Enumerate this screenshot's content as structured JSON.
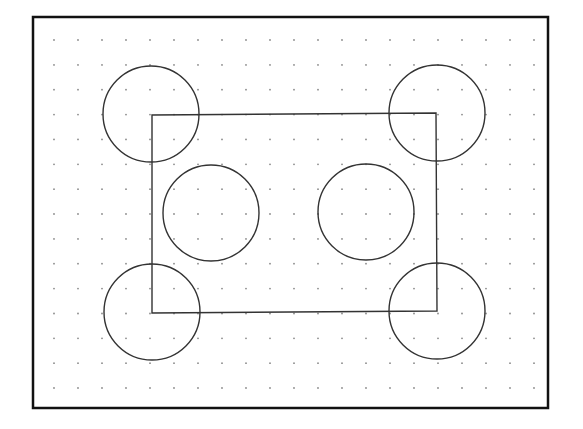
{
  "drawing": {
    "background": "#ffffff",
    "frame": {
      "x": 33,
      "y": 17,
      "width": 515,
      "height": 391,
      "stroke": "#111111",
      "stroke_width": 2.5
    },
    "grid": {
      "dot_color": "#8a8a8a",
      "dot_radius": 0.9,
      "x_start": 54,
      "x_step": 24,
      "columns": 21,
      "y_start": 40,
      "y_step": 24.86,
      "rows": 15
    },
    "shape_stroke": "#333333",
    "shape_stroke_width": 1.4,
    "rectangle": {
      "points": [
        [
          152,
          115
        ],
        [
          436,
          113
        ],
        [
          437,
          311
        ],
        [
          152,
          313
        ]
      ]
    },
    "circles": [
      {
        "name": "circle-top-left",
        "cx": 151,
        "cy": 114,
        "r": 48
      },
      {
        "name": "circle-top-right",
        "cx": 437,
        "cy": 113,
        "r": 48
      },
      {
        "name": "circle-bottom-left",
        "cx": 152,
        "cy": 312,
        "r": 48
      },
      {
        "name": "circle-bottom-right",
        "cx": 437,
        "cy": 311,
        "r": 48
      },
      {
        "name": "circle-inner-left",
        "cx": 211,
        "cy": 213,
        "r": 48
      },
      {
        "name": "circle-inner-right",
        "cx": 366,
        "cy": 212,
        "r": 48
      }
    ]
  }
}
